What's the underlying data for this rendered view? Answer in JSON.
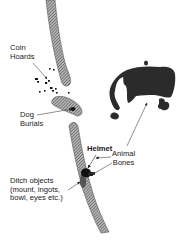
{
  "diagram": {
    "type": "archaeological site plan",
    "colors": {
      "ditch_fill": "#8c8c8c",
      "ditch_hatch": "#3a3a3a",
      "bones_fill": "#2b2b2b",
      "finds_fill": "#111111",
      "text": "#1a1a1a",
      "leader_line": "#444444"
    },
    "labels": {
      "coin_hoards": [
        "Coin",
        "Hoards"
      ],
      "dog_burials": [
        "Dog",
        "Burials"
      ],
      "helmet": "Helmet",
      "ditch_objects": [
        "Ditch objects",
        "(mount, ingots,",
        "bowl, eyes etc.)"
      ],
      "animal_bones": [
        "Animal",
        "Bones"
      ]
    }
  }
}
